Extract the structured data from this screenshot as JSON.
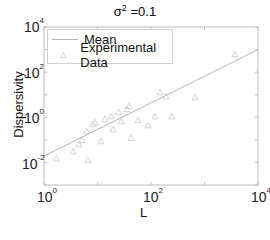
{
  "chart_data": {
    "type": "scatter",
    "title_base": "σ",
    "title_exp": "2",
    "title_rest": " =0.1",
    "xlabel": "L",
    "ylabel": "Dispersivity",
    "xscale": "log",
    "yscale": "log",
    "xlim": [
      1,
      10000
    ],
    "ylim": [
      0.001,
      10000
    ],
    "grid": false,
    "legend_position": "upper left",
    "x_ticks": [
      {
        "base": "10",
        "exp": "0"
      },
      {
        "base": "10",
        "exp": "2"
      },
      {
        "base": "10",
        "exp": "4"
      }
    ],
    "y_ticks": [
      {
        "base": "10",
        "exp": "4"
      },
      {
        "base": "10",
        "exp": "2"
      },
      {
        "base": "10",
        "exp": "0"
      },
      {
        "base": "10",
        "exp": "-2"
      }
    ],
    "legend": [
      "Mean",
      "Experimental Data"
    ],
    "series": [
      {
        "name": "Mean",
        "type": "line",
        "color": "#b5b5b5",
        "x": [
          1,
          10000
        ],
        "y": [
          0.019,
          1000
        ]
      },
      {
        "name": "Experimental Data",
        "type": "scatter",
        "marker": "triangle",
        "color": "#c8c8c8",
        "x": [
          1.7,
          3.5,
          4.5,
          5.1,
          6.6,
          6.3,
          8.2,
          8.9,
          11.6,
          13.8,
          17.9,
          19.5,
          25,
          27.5,
          35.5,
          39,
          42,
          57,
          88,
          118,
          148,
          191,
          245,
          661,
          3700
        ],
        "y": [
          0.015,
          0.031,
          0.064,
          0.096,
          0.013,
          0.24,
          0.49,
          0.6,
          0.087,
          0.82,
          1.1,
          0.29,
          1.7,
          0.66,
          2.3,
          3.1,
          0.12,
          0.74,
          0.44,
          1.1,
          12.8,
          8.5,
          1.1,
          7.6,
          617
        ]
      }
    ]
  },
  "colors": {
    "axis": "#bdbdbd",
    "mean_line": "#b5b5b5",
    "marker": "#c8c8c8"
  }
}
